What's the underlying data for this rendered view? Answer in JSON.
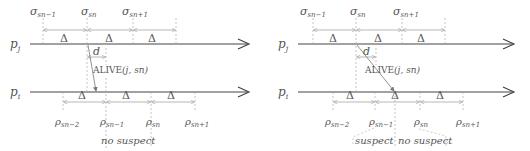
{
  "panels": [
    {
      "id": "left",
      "process_top": "p_j",
      "process_bottom": "p_i",
      "sigma_labels": [
        "σ_{sn−1}",
        "σ_{sn}",
        "σ_{sn+1}"
      ],
      "rho_labels": [
        "ρ_{sn−2}",
        "ρ_{sn−1}",
        "ρ_{sn}",
        "ρ_{sn+1}"
      ],
      "delta_label": "Δ",
      "d_label": "d",
      "message_label": "ALIVE(j, sn)",
      "region_labels": [
        "no suspect"
      ]
    },
    {
      "id": "right",
      "process_top": "p_j",
      "process_bottom": "p_i",
      "sigma_labels": [
        "σ_{sn−1}",
        "σ_{sn}",
        "σ_{sn+1}"
      ],
      "rho_labels": [
        "ρ_{sn−2}",
        "ρ_{sn−1}",
        "ρ_{sn}",
        "ρ_{sn+1}"
      ],
      "delta_label": "Δ",
      "d_label": "d",
      "message_label": "ALIVE(j, sn)",
      "region_labels": [
        "suspect",
        "no suspect"
      ]
    }
  ],
  "text": {
    "pj": "p",
    "pj_sub": "j",
    "pi": "p",
    "pi_sub": "i",
    "sigma": "σ",
    "rho": "ρ",
    "sub_sn_minus1": "sn−1",
    "sub_sn": "sn",
    "sub_sn_plus1": "sn+1",
    "sub_sn_minus2": "sn−2",
    "delta": "Δ",
    "d": "d",
    "alive": "ALIVE",
    "alive_args": "(j, sn)",
    "no_suspect": "no suspect",
    "suspect": "suspect"
  }
}
